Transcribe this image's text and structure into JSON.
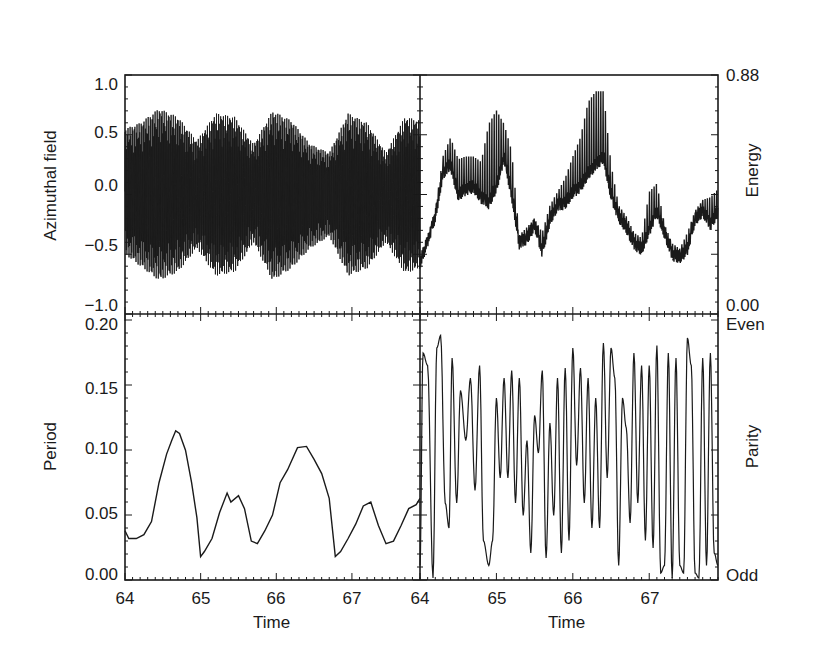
{
  "chart_data": [
    {
      "panel": "top-left",
      "type": "line",
      "title": "",
      "xlabel": "",
      "ylabel": "Azimuthal field",
      "xlim": [
        64,
        67.9
      ],
      "ylim": [
        -1.0,
        1.0
      ],
      "y_ticks": [
        "1.0",
        "0.5",
        "0.0",
        "-0.5",
        "-1.0"
      ],
      "y_tick_values": [
        1.0,
        0.5,
        0.0,
        -0.5,
        -1.0
      ],
      "grid": false,
      "description": "Rapidly oscillating signal with beating envelope; amplitude ~0.5–0.75",
      "envelope": {
        "x": [
          64.0,
          64.2,
          64.45,
          64.7,
          64.95,
          65.2,
          65.45,
          65.7,
          65.95,
          66.2,
          66.45,
          66.7,
          66.95,
          67.2,
          67.45,
          67.7,
          67.9
        ],
        "upper": [
          0.55,
          0.6,
          0.72,
          0.65,
          0.45,
          0.68,
          0.65,
          0.42,
          0.7,
          0.62,
          0.42,
          0.35,
          0.68,
          0.6,
          0.35,
          0.65,
          0.62
        ],
        "lower": [
          -0.5,
          -0.6,
          -0.72,
          -0.65,
          -0.45,
          -0.68,
          -0.65,
          -0.4,
          -0.72,
          -0.62,
          -0.45,
          -0.35,
          -0.68,
          -0.62,
          -0.4,
          -0.66,
          -0.62
        ]
      }
    },
    {
      "panel": "top-right",
      "type": "line",
      "title": "",
      "xlabel": "",
      "ylabel": "Energy",
      "xlim": [
        64,
        67.9
      ],
      "ylim": [
        0.0,
        0.88
      ],
      "y_ticks": [
        "0.88",
        "0.00"
      ],
      "y_tick_values": [
        0.88,
        0.0
      ],
      "grid": false,
      "x": [
        64.0,
        64.1,
        64.2,
        64.3,
        64.4,
        64.5,
        64.6,
        64.7,
        64.8,
        64.9,
        65.0,
        65.1,
        65.2,
        65.3,
        65.4,
        65.5,
        65.6,
        65.7,
        65.8,
        65.9,
        66.0,
        66.1,
        66.2,
        66.3,
        66.4,
        66.5,
        66.6,
        66.7,
        66.8,
        66.9,
        67.0,
        67.1,
        67.2,
        67.3,
        67.4,
        67.5,
        67.6,
        67.7,
        67.8,
        67.9
      ],
      "values": [
        0.19,
        0.27,
        0.36,
        0.52,
        0.55,
        0.44,
        0.46,
        0.47,
        0.43,
        0.41,
        0.47,
        0.58,
        0.44,
        0.26,
        0.28,
        0.33,
        0.23,
        0.35,
        0.4,
        0.41,
        0.45,
        0.47,
        0.52,
        0.55,
        0.58,
        0.44,
        0.36,
        0.32,
        0.26,
        0.24,
        0.31,
        0.38,
        0.3,
        0.22,
        0.21,
        0.24,
        0.35,
        0.38,
        0.33,
        0.38
      ],
      "spikes_max": [
        0.19,
        0.28,
        0.38,
        0.58,
        0.65,
        0.57,
        0.58,
        0.58,
        0.56,
        0.7,
        0.75,
        0.7,
        0.6,
        0.29,
        0.32,
        0.35,
        0.3,
        0.4,
        0.45,
        0.5,
        0.58,
        0.65,
        0.78,
        0.82,
        0.82,
        0.55,
        0.4,
        0.36,
        0.3,
        0.28,
        0.45,
        0.48,
        0.33,
        0.26,
        0.24,
        0.3,
        0.38,
        0.42,
        0.43,
        0.46
      ]
    },
    {
      "panel": "bottom-left",
      "type": "line",
      "title": "",
      "xlabel": "Time",
      "ylabel": "Period",
      "xlim": [
        64,
        67.9
      ],
      "ylim": [
        0.0,
        0.2
      ],
      "x_ticks": [
        "64",
        "65",
        "66",
        "67"
      ],
      "y_ticks": [
        "0.20",
        "0.15",
        "0.10",
        "0.05",
        "0.00"
      ],
      "y_tick_values": [
        0.2,
        0.15,
        0.1,
        0.05,
        0.0
      ],
      "grid": false,
      "x": [
        64.0,
        64.05,
        64.15,
        64.25,
        64.35,
        64.45,
        64.55,
        64.62,
        64.67,
        64.72,
        64.8,
        64.88,
        64.95,
        65.0,
        65.05,
        65.15,
        65.25,
        65.35,
        65.4,
        65.5,
        65.58,
        65.67,
        65.75,
        65.85,
        65.95,
        66.05,
        66.15,
        66.28,
        66.4,
        66.5,
        66.6,
        66.7,
        66.78,
        66.85,
        66.95,
        67.05,
        67.15,
        67.25,
        67.35,
        67.45,
        67.55,
        67.65,
        67.75,
        67.85,
        67.9
      ],
      "values": [
        0.038,
        0.032,
        0.032,
        0.035,
        0.045,
        0.075,
        0.097,
        0.108,
        0.115,
        0.113,
        0.1,
        0.075,
        0.048,
        0.018,
        0.022,
        0.032,
        0.052,
        0.067,
        0.06,
        0.065,
        0.055,
        0.03,
        0.028,
        0.038,
        0.05,
        0.075,
        0.085,
        0.102,
        0.103,
        0.093,
        0.082,
        0.063,
        0.018,
        0.022,
        0.032,
        0.043,
        0.057,
        0.06,
        0.042,
        0.028,
        0.03,
        0.042,
        0.055,
        0.058,
        0.063
      ]
    },
    {
      "panel": "bottom-right",
      "type": "line",
      "title": "",
      "xlabel": "Time",
      "ylabel": "Parity",
      "xlim": [
        64,
        67.9
      ],
      "ylim": [
        "Odd",
        "Even"
      ],
      "x_ticks": [
        "64",
        "65",
        "66",
        "67"
      ],
      "y_ticks": [
        "Even",
        "Odd"
      ],
      "grid": false,
      "description": "Parity oscillates between Odd (0) and Even (1) with rapid switching",
      "x": [
        64.0,
        64.04,
        64.1,
        64.17,
        64.22,
        64.27,
        64.33,
        64.38,
        64.42,
        64.48,
        64.53,
        64.6,
        64.66,
        64.72,
        64.78,
        64.83,
        64.9,
        64.95,
        65.0,
        65.05,
        65.1,
        65.15,
        65.2,
        65.25,
        65.3,
        65.35,
        65.4,
        65.45,
        65.5,
        65.55,
        65.6,
        65.65,
        65.7,
        65.75,
        65.8,
        65.85,
        65.9,
        65.95,
        66.0,
        66.05,
        66.1,
        66.15,
        66.2,
        66.25,
        66.3,
        66.35,
        66.4,
        66.45,
        66.5,
        66.55,
        66.6,
        66.65,
        66.7,
        66.75,
        66.8,
        66.85,
        66.9,
        66.95,
        67.0,
        67.05,
        67.1,
        67.15,
        67.2,
        67.25,
        67.3,
        67.35,
        67.4,
        67.45,
        67.5,
        67.55,
        67.6,
        67.65,
        67.7,
        67.75,
        67.8,
        67.85,
        67.9
      ],
      "values": [
        0.05,
        0.9,
        0.85,
        0.0,
        0.92,
        0.97,
        0.3,
        0.2,
        0.88,
        0.3,
        0.75,
        0.55,
        0.8,
        0.35,
        0.85,
        0.15,
        0.05,
        0.15,
        0.72,
        0.4,
        0.8,
        0.4,
        0.83,
        0.3,
        0.8,
        0.25,
        0.55,
        0.1,
        0.65,
        0.5,
        0.83,
        0.08,
        0.62,
        0.25,
        0.8,
        0.1,
        0.84,
        0.15,
        0.92,
        0.45,
        0.84,
        0.3,
        0.8,
        0.2,
        0.72,
        0.2,
        0.94,
        0.4,
        0.92,
        0.8,
        0.05,
        0.72,
        0.6,
        0.22,
        0.9,
        0.3,
        0.85,
        0.15,
        0.85,
        0.12,
        0.93,
        0.02,
        0.05,
        0.9,
        0.0,
        0.88,
        0.05,
        0.02,
        0.96,
        0.85,
        0.02,
        0.0,
        0.88,
        0.05,
        0.9,
        0.1,
        0.05
      ]
    }
  ],
  "figure": {
    "axis_titles": {
      "top_left_y": "Azimuthal field",
      "top_right_y": "Energy",
      "bottom_left_y": "Period",
      "bottom_right_y": "Parity",
      "bottom_left_x": "Time",
      "bottom_right_x": "Time"
    },
    "tick_labels": {
      "top_left_y": [
        "1.0",
        "0.5",
        "0.0",
        "−0.5",
        "−1.0"
      ],
      "top_right_y": [
        "0.88",
        "0.00"
      ],
      "bottom_left_y": [
        "0.20",
        "0.15",
        "0.10",
        "0.05",
        "0.00"
      ],
      "bottom_right_y": [
        "Even",
        "Odd"
      ],
      "bottom_left_x": [
        "64",
        "65",
        "66",
        "67"
      ],
      "bottom_right_x": [
        "64",
        "65",
        "66",
        "67"
      ]
    },
    "colors": {
      "line": "#1a1a1a",
      "axis": "#1a1a1a",
      "background": "#ffffff"
    }
  }
}
